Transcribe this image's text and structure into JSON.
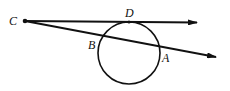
{
  "diagram": {
    "type": "geometry",
    "points": {
      "C": {
        "label": "C",
        "x": 25,
        "y": 21
      },
      "D": {
        "label": "D",
        "x": 129,
        "y": 22
      },
      "B": {
        "label": "B",
        "x": 102,
        "y": 38
      },
      "A": {
        "label": "A",
        "x": 158,
        "y": 48
      }
    },
    "circle": {
      "cx": 129,
      "cy": 53,
      "r": 31
    },
    "rays": [
      {
        "name": "tangent-ray-CD",
        "from": "C",
        "through": "D"
      },
      {
        "name": "secant-ray-CBA",
        "from": "C",
        "through": [
          "B",
          "A"
        ]
      }
    ],
    "colors": {
      "stroke": "#111111",
      "background": "#ffffff"
    }
  }
}
